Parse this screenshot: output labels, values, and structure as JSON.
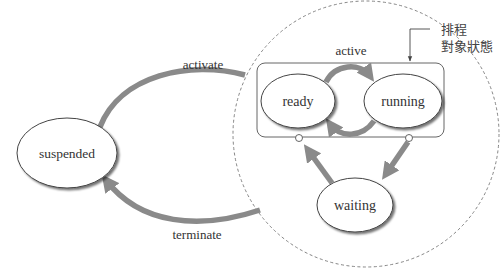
{
  "diagram": {
    "annotation": {
      "line1": "排程",
      "line2": "對象狀態"
    },
    "group": {
      "label": "active"
    },
    "states": {
      "ready": "ready",
      "running": "running",
      "waiting": "waiting",
      "suspended": "suspended"
    },
    "transitions": {
      "activate": "activate",
      "terminate": "terminate"
    },
    "colors": {
      "arrow": "#8a8a8a",
      "stroke": "#555555",
      "dashed": "#777777",
      "background": "#ffffff"
    }
  }
}
